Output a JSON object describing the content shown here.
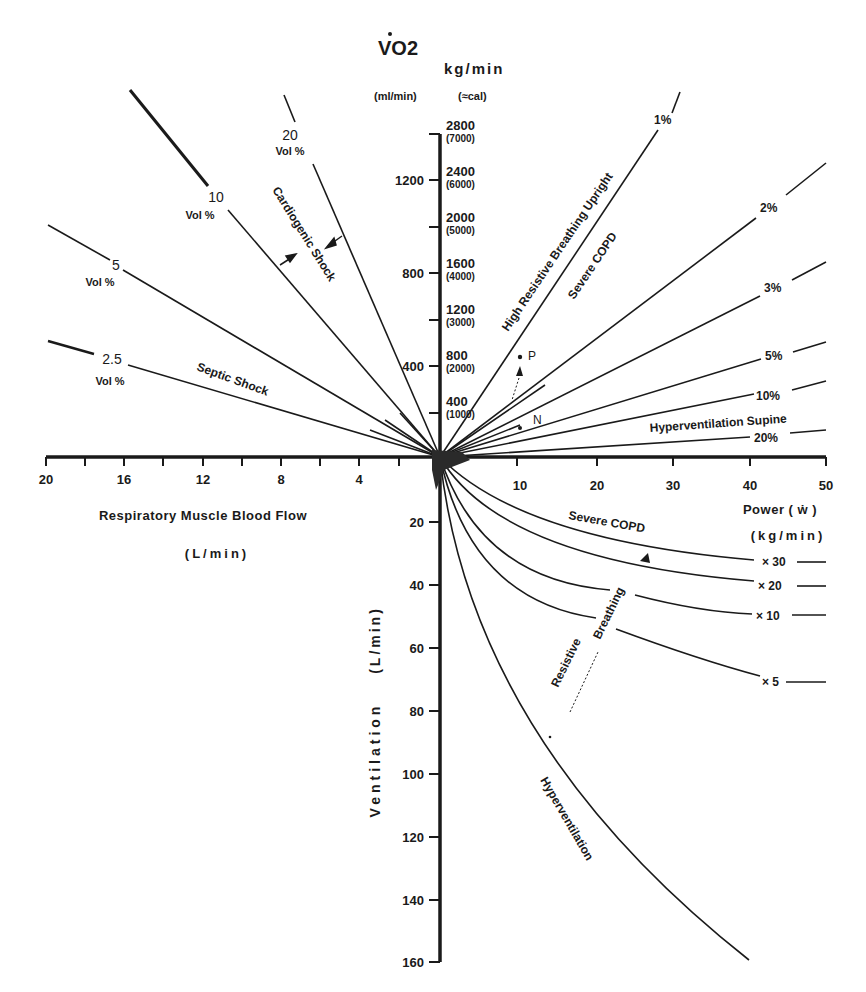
{
  "diagram": {
    "type": "four-quadrant nomogram",
    "colors": {
      "ink": "#1a1a1a",
      "background": "#ffffff"
    },
    "top_axis": {
      "title_vo2": "VO2",
      "vo2_unit": "(ml/min)",
      "work_unit": "kg/min",
      "work_unit_sub": "(≈cal)",
      "vo2_ticks": [
        {
          "value": 400,
          "label": "400"
        },
        {
          "value": 800,
          "label": "800"
        },
        {
          "value": 1200,
          "label": "1200"
        }
      ],
      "work_ticks": [
        {
          "main": "400",
          "sub": "(1000)"
        },
        {
          "main": "800",
          "sub": "(2000)"
        },
        {
          "main": "1200",
          "sub": "(3000)"
        },
        {
          "main": "1600",
          "sub": "(4000)"
        },
        {
          "main": "2000",
          "sub": "(5000)"
        },
        {
          "main": "2400",
          "sub": "(6000)"
        },
        {
          "main": "2800",
          "sub": "(7000)"
        }
      ]
    },
    "left_axis": {
      "title": "Respiratory Muscle Blood Flow",
      "unit": "(L/min)",
      "ticks": [
        "20",
        "16",
        "12",
        "8",
        "4"
      ]
    },
    "right_axis": {
      "title": "Power ( ẇ )",
      "unit": "(kg/min)",
      "ticks": [
        "10",
        "20",
        "30",
        "40",
        "50"
      ]
    },
    "bottom_axis": {
      "title": "Ventilation",
      "unit": "(L/min)",
      "ticks": [
        "20",
        "40",
        "60",
        "80",
        "100",
        "120",
        "140",
        "160"
      ]
    },
    "upper_left_lines": [
      {
        "value": "20",
        "unit": "Vol %"
      },
      {
        "value": "10",
        "unit": "Vol %"
      },
      {
        "value": "5",
        "unit": "Vol %"
      },
      {
        "value": "2.5",
        "unit": "Vol %"
      }
    ],
    "upper_left_annotations": {
      "cardiogenic": "Cardiogenic Shock",
      "septic": "Septic Shock"
    },
    "upper_right_lines": [
      {
        "label": "1%"
      },
      {
        "label": "2%"
      },
      {
        "label": "3%"
      },
      {
        "label": "5%"
      },
      {
        "label": "10%"
      },
      {
        "label": "20%"
      }
    ],
    "upper_right_annotations": {
      "high_resistive": "High Resistive Breathing Upright",
      "severe_copd": "Severe COPD",
      "hyperventilation_supine": "Hyperventilation Supine",
      "point_p": "P",
      "point_n": "N"
    },
    "lower_right_curves": [
      {
        "label": "× 30"
      },
      {
        "label": "× 20"
      },
      {
        "label": "× 10"
      },
      {
        "label": "× 5"
      }
    ],
    "lower_right_annotations": {
      "severe_copd": "Severe COPD",
      "resistive": "Resistive",
      "breathing": "Breathing",
      "hyperventilation": "Hyperventilation"
    }
  }
}
